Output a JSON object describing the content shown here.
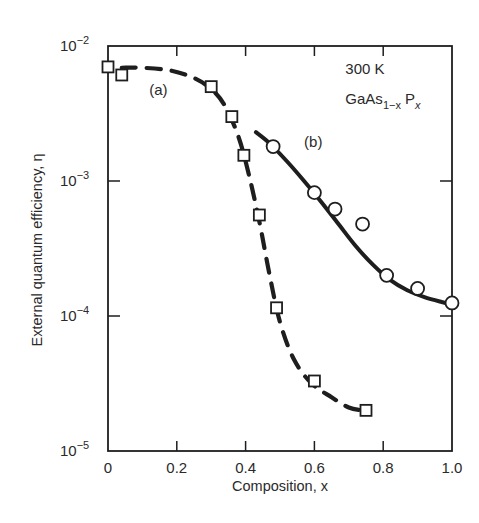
{
  "chart_data": {
    "type": "scatter",
    "title": "",
    "xlabel": "Composition, x",
    "ylabel": "External quantum efficiency, η",
    "xlim": [
      0,
      1.0
    ],
    "ylim": [
      1e-05,
      0.01
    ],
    "yscale": "log",
    "grid": false,
    "legend": "none (curves labeled inline)",
    "x_ticks": [
      0,
      0.2,
      0.4,
      0.6,
      0.8,
      1.0
    ],
    "x_tick_labels": [
      "0",
      "0.2",
      "0.4",
      "0.6",
      "0.8",
      "1.0"
    ],
    "y_ticks": [
      0.01,
      0.001,
      0.0001,
      1e-05
    ],
    "y_tick_labels": [
      {
        "base": "10",
        "exp": "−2"
      },
      {
        "base": "10",
        "exp": "−3"
      },
      {
        "base": "10",
        "exp": "−4"
      },
      {
        "base": "10",
        "exp": "−5"
      }
    ],
    "annotations": [
      {
        "text": "300 K",
        "x": 0.69,
        "y": 0.0062
      },
      {
        "text": "GaAs",
        "sub": "1−x",
        "text2": "P",
        "sub2": "x",
        "x": 0.69,
        "y": 0.0037
      },
      {
        "text": "(a)",
        "x": 0.12,
        "y": 0.0043
      },
      {
        "text": "(b)",
        "x": 0.57,
        "y": 0.0018
      }
    ],
    "series": [
      {
        "name": "(a)",
        "marker": "square",
        "line": "dashed",
        "x": [
          0.0,
          0.04,
          0.3,
          0.36,
          0.395,
          0.44,
          0.49,
          0.6,
          0.75
        ],
        "y": [
          0.007,
          0.0061,
          0.005,
          0.003,
          0.00155,
          0.00056,
          0.000115,
          3.3e-05,
          2e-05
        ],
        "curve_x": [
          0.04,
          0.1,
          0.18,
          0.25,
          0.3,
          0.34,
          0.38,
          0.41,
          0.44,
          0.47,
          0.5,
          0.54,
          0.59,
          0.65,
          0.7,
          0.74
        ],
        "curve_y": [
          0.0069,
          0.0069,
          0.0066,
          0.0058,
          0.0048,
          0.0036,
          0.0021,
          0.0011,
          0.0005,
          0.0002,
          9e-05,
          4.8e-05,
          3.2e-05,
          2.5e-05,
          2.1e-05,
          2e-05
        ]
      },
      {
        "name": "(b)",
        "marker": "circle",
        "line": "solid",
        "x": [
          0.48,
          0.6,
          0.66,
          0.74,
          0.81,
          0.9,
          1.0
        ],
        "y": [
          0.0018,
          0.00082,
          0.00062,
          0.00048,
          0.0002,
          0.00016,
          0.000125
        ],
        "curve_x": [
          0.43,
          0.47,
          0.52,
          0.57,
          0.62,
          0.67,
          0.72,
          0.77,
          0.82,
          0.87,
          0.92,
          0.97,
          1.0
        ],
        "curve_y": [
          0.0023,
          0.0019,
          0.0014,
          0.001,
          0.0007,
          0.00048,
          0.00033,
          0.00024,
          0.000185,
          0.000155,
          0.000138,
          0.000127,
          0.000122
        ]
      }
    ]
  }
}
